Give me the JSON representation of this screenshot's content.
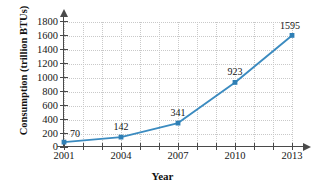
{
  "chart_data": {
    "type": "line",
    "title": "",
    "subtitle": "",
    "xlabel": "Year",
    "ylabel": "Consumption (trillion BTUs)",
    "x": [
      2001,
      2004,
      2007,
      2010,
      2013
    ],
    "values": [
      70,
      142,
      341,
      923,
      1595
    ],
    "categories": [
      "2001",
      "2004",
      "2007",
      "2010",
      "2013"
    ],
    "point_labels": [
      "70",
      "142",
      "341",
      "923",
      "1595"
    ],
    "xlim": [
      2001,
      2013
    ],
    "ylim": [
      0,
      1800
    ],
    "x_tick_labels": [
      "2001",
      "2004",
      "2007",
      "2010",
      "2013"
    ],
    "x_tick_values": [
      2001,
      2004,
      2007,
      2010,
      2013
    ],
    "x_minor_tick_values": [
      2002,
      2003,
      2005,
      2006,
      2008,
      2009,
      2011,
      2012
    ],
    "y_tick_labels": [
      "0",
      "200",
      "400",
      "600",
      "800",
      "1000",
      "1200",
      "1400",
      "1600",
      "1800"
    ],
    "y_tick_values": [
      0,
      200,
      400,
      600,
      800,
      1000,
      1200,
      1400,
      1600,
      1800
    ],
    "grid": true,
    "grid_style": "dotted",
    "legend": false,
    "legend_position": "none",
    "marker": "square",
    "series_color": "#3b8bc0",
    "grid_color": "#c9c9c9",
    "axis_color": "#4a4a4a",
    "text_color": "#171717",
    "annotations": []
  }
}
